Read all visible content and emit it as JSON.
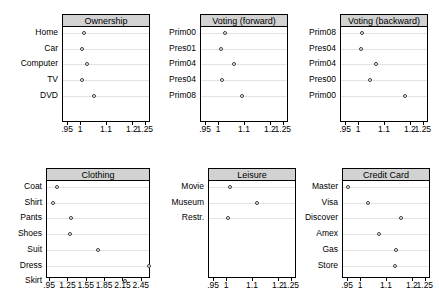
{
  "chart_data": [
    {
      "type": "scatter",
      "title": "Ownership",
      "xlabel": "",
      "ylabel": "",
      "xlim": [
        0.93,
        1.27
      ],
      "grid": true,
      "legend": "none",
      "ticks": [
        {
          "value": 0.95,
          "label": ".95"
        },
        {
          "value": 1.0,
          "label": "1"
        },
        {
          "value": 1.1,
          "label": "1.1"
        },
        {
          "value": 1.2,
          "label": "1.2"
        },
        {
          "value": 1.25,
          "label": "1.25"
        }
      ],
      "categories": [
        "Home",
        "Car",
        "Computer",
        "TV",
        "DVD"
      ],
      "values": [
        1.012,
        1.005,
        1.021,
        1.004,
        1.048
      ]
    },
    {
      "type": "scatter",
      "title": "Voting (forward)",
      "xlabel": "",
      "ylabel": "",
      "xlim": [
        0.93,
        1.27
      ],
      "grid": true,
      "legend": "none",
      "ticks": [
        {
          "value": 0.95,
          "label": ".95"
        },
        {
          "value": 1.0,
          "label": "1"
        },
        {
          "value": 1.1,
          "label": "1.1"
        },
        {
          "value": 1.2,
          "label": "1.2"
        },
        {
          "value": 1.25,
          "label": "1.25"
        }
      ],
      "categories": [
        "Prim00",
        "Pres01",
        "Prim04",
        "Pres04",
        "Prim08"
      ],
      "values": [
        1.023,
        1.008,
        1.057,
        1.011,
        1.087
      ]
    },
    {
      "type": "scatter",
      "title": "Voting (backward)",
      "xlabel": "",
      "ylabel": "",
      "xlim": [
        0.93,
        1.27
      ],
      "grid": true,
      "legend": "none",
      "ticks": [
        {
          "value": 0.95,
          "label": ".95"
        },
        {
          "value": 1.0,
          "label": "1"
        },
        {
          "value": 1.1,
          "label": "1.1"
        },
        {
          "value": 1.2,
          "label": "1.2"
        },
        {
          "value": 1.25,
          "label": "1.25"
        }
      ],
      "categories": [
        "Prim08",
        "Pres04",
        "Prim04",
        "Pres00",
        "Prim00"
      ],
      "values": [
        1.012,
        1.008,
        1.067,
        1.041,
        1.178
      ]
    },
    {
      "type": "scatter",
      "title": "Clothing",
      "xlabel": "",
      "ylabel": "",
      "xlim": [
        0.9,
        2.6
      ],
      "grid": true,
      "legend": "none",
      "ticks": [
        {
          "value": 0.95,
          "label": ".95"
        },
        {
          "value": 1.25,
          "label": "1.25"
        },
        {
          "value": 1.55,
          "label": "1.55"
        },
        {
          "value": 1.85,
          "label": "1.85"
        },
        {
          "value": 2.15,
          "label": "2.15"
        },
        {
          "value": 2.45,
          "label": "2.45"
        }
      ],
      "categories": [
        "Coat",
        "Shirt",
        "Pants",
        "Shoes",
        "Suit",
        "Dress",
        "Skirt"
      ],
      "values": [
        1.07,
        0.99,
        1.3,
        1.28,
        1.74,
        2.56,
        2.17
      ]
    },
    {
      "type": "scatter",
      "title": "Leisure",
      "xlabel": "",
      "ylabel": "",
      "xlim": [
        0.93,
        1.27
      ],
      "grid": true,
      "legend": "none",
      "ticks": [
        {
          "value": 0.95,
          "label": ".95"
        },
        {
          "value": 1.0,
          "label": "1"
        },
        {
          "value": 1.1,
          "label": "1.1"
        },
        {
          "value": 1.2,
          "label": "1.2"
        },
        {
          "value": 1.25,
          "label": "1.25"
        }
      ],
      "categories": [
        "Movie",
        "Museum",
        "Restr."
      ],
      "values": [
        1.013,
        1.117,
        1.005
      ]
    },
    {
      "type": "scatter",
      "title": "Credit Card",
      "xlabel": "",
      "ylabel": "",
      "xlim": [
        0.93,
        1.27
      ],
      "grid": true,
      "legend": "none",
      "ticks": [
        {
          "value": 0.95,
          "label": ".95"
        },
        {
          "value": 1.0,
          "label": "1"
        },
        {
          "value": 1.1,
          "label": "1.1"
        },
        {
          "value": 1.2,
          "label": "1.2"
        },
        {
          "value": 1.25,
          "label": "1.25"
        }
      ],
      "categories": [
        "Master",
        "Visa",
        "Discover",
        "Amex",
        "Gas",
        "Store"
      ],
      "values": [
        0.949,
        1.025,
        1.155,
        1.068,
        1.135,
        1.132
      ]
    }
  ],
  "colors": {
    "header_fill": "#d2d2d2",
    "frame": "#000000",
    "gridline": "#e3e3e3",
    "marker": "#3a3a3a",
    "background": "#ffffff"
  }
}
